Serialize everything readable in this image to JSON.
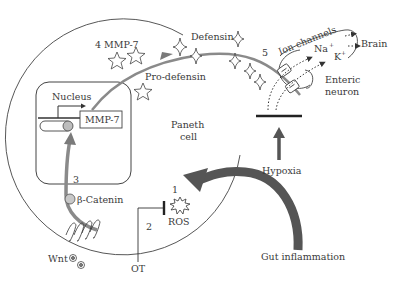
{
  "diagram": {
    "type": "pathway-schematic",
    "colors": {
      "outline": "#444444",
      "arrow_gray": "#7a7a7a",
      "arrow_dark": "#555555",
      "circle_fill": "#cccccc",
      "background": "#ffffff"
    },
    "labels": {
      "nucleus": "Nucleus",
      "mmp7_gene": "MMP-7",
      "step4_mmp7": "4 MMP-7",
      "pro_defensin": "Pro-defensin",
      "defensin": "Defensin",
      "paneth_line1": "Paneth",
      "paneth_line2": "cell",
      "beta_catenin": "β-Catenin",
      "ros": "ROS",
      "ot": "OT",
      "wnt": "Wnt",
      "hypoxia": "Hypoxia",
      "gut_inflammation": "Gut inflammation",
      "ion_channels": "Ion channels",
      "na": "Na",
      "k": "K",
      "plus": "+",
      "brain": "Brain",
      "enteric_line1": "Enteric",
      "enteric_line2": "neuron"
    },
    "step_numbers": {
      "s1": "1",
      "s2": "2",
      "s3": "3",
      "s5": "5"
    }
  }
}
